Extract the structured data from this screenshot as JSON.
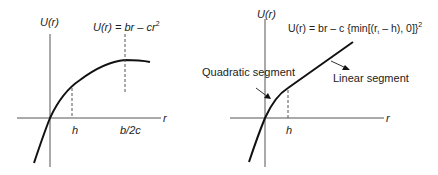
{
  "left_panel": {
    "y_axis_label": "U(r)",
    "x_axis_label": "r",
    "formula": {
      "lhs": "U(r) = ",
      "b": "br",
      "minus": " – ",
      "c": "cr",
      "exp": "2"
    },
    "tick_h": "h",
    "tick_peak": "b/2c"
  },
  "right_panel": {
    "y_axis_label": "U(r)",
    "x_axis_label": "r",
    "formula": {
      "main": "U(r) = br – c {min[(r",
      "sub": "t",
      "rest": " – h), 0]}",
      "exp": "2"
    },
    "tick_h": "h",
    "annotation_quadratic": "Quadratic segment",
    "annotation_linear": "Linear segment"
  },
  "colors": {
    "ink": "#222222",
    "background": "#ffffff"
  }
}
